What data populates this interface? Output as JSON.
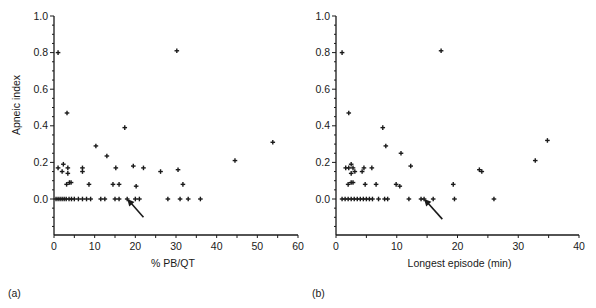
{
  "chart_data": [
    {
      "panel_label": "(a)",
      "type": "scatter",
      "title": "",
      "xlabel": "% PB/QT",
      "ylabel": "Apneic index",
      "xlim": [
        0,
        60
      ],
      "ylim": [
        -0.15,
        1.0
      ],
      "xticks": [
        0,
        10,
        20,
        30,
        40,
        50,
        60
      ],
      "yticks": [
        0.0,
        0.2,
        0.4,
        0.6,
        0.8,
        1.0
      ],
      "ytick_labels": [
        "0.0",
        "0.2",
        "0.4",
        "0.6",
        "0.8",
        "1.0"
      ],
      "grid": false,
      "marker": "+",
      "annotation": {
        "type": "arrow",
        "points_to": [
          18,
          0.0
        ],
        "from": [
          22,
          -0.1
        ]
      },
      "points": [
        [
          1,
          0.8
        ],
        [
          3.2,
          0.47
        ],
        [
          10.3,
          0.29
        ],
        [
          13,
          0.235
        ],
        [
          17.4,
          0.39
        ],
        [
          30.2,
          0.81
        ],
        [
          53.8,
          0.31
        ],
        [
          44.5,
          0.21
        ],
        [
          1,
          0.17
        ],
        [
          2.3,
          0.19
        ],
        [
          2,
          0.15
        ],
        [
          3.4,
          0.17
        ],
        [
          3.4,
          0.14
        ],
        [
          3.1,
          0.08
        ],
        [
          3.8,
          0.09
        ],
        [
          4.2,
          0.09
        ],
        [
          7,
          0.17
        ],
        [
          7,
          0.15
        ],
        [
          8.6,
          0.08
        ],
        [
          15.2,
          0.17
        ],
        [
          14.5,
          0.08
        ],
        [
          16,
          0.08
        ],
        [
          19.5,
          0.18
        ],
        [
          20.2,
          0.07
        ],
        [
          22,
          0.17
        ],
        [
          26.2,
          0.15
        ],
        [
          30.5,
          0.16
        ],
        [
          31.7,
          0.08
        ],
        [
          0.5,
          0
        ],
        [
          1,
          0
        ],
        [
          1.5,
          0
        ],
        [
          2,
          0
        ],
        [
          2.5,
          0
        ],
        [
          3,
          0
        ],
        [
          3.7,
          0
        ],
        [
          4.3,
          0
        ],
        [
          5,
          0
        ],
        [
          6,
          0
        ],
        [
          7,
          0
        ],
        [
          8,
          0
        ],
        [
          9,
          0
        ],
        [
          11.5,
          0
        ],
        [
          12.5,
          0
        ],
        [
          15,
          0
        ],
        [
          16,
          0
        ],
        [
          18,
          0
        ],
        [
          20,
          0
        ],
        [
          21,
          0
        ],
        [
          28,
          0
        ],
        [
          31,
          0
        ],
        [
          33,
          0
        ],
        [
          36,
          0
        ]
      ]
    },
    {
      "panel_label": "(b)",
      "type": "scatter",
      "title": "",
      "xlabel": "Longest episode (min)",
      "ylabel": "",
      "xlim": [
        0,
        40
      ],
      "ylim": [
        -0.15,
        1.0
      ],
      "xticks": [
        0,
        10,
        20,
        30,
        40
      ],
      "yticks": [
        0.0,
        0.2,
        0.4,
        0.6,
        0.8,
        1.0
      ],
      "ytick_labels": [
        "0.0",
        "0.2",
        "0.4",
        "0.6",
        "0.8",
        "1.0"
      ],
      "grid": false,
      "marker": "+",
      "annotation": {
        "type": "arrow",
        "points_to": [
          14.5,
          0.0
        ],
        "from": [
          17.5,
          -0.11
        ]
      },
      "points": [
        [
          1,
          0.8
        ],
        [
          2.1,
          0.47
        ],
        [
          7.7,
          0.39
        ],
        [
          8.2,
          0.29
        ],
        [
          10.7,
          0.25
        ],
        [
          17.3,
          0.81
        ],
        [
          34.8,
          0.32
        ],
        [
          32.8,
          0.21
        ],
        [
          1.6,
          0.17
        ],
        [
          2.1,
          0.17
        ],
        [
          2.5,
          0.19
        ],
        [
          2.8,
          0.17
        ],
        [
          2.5,
          0.14
        ],
        [
          3.1,
          0.15
        ],
        [
          4.3,
          0.15
        ],
        [
          4.6,
          0.17
        ],
        [
          5.9,
          0.17
        ],
        [
          2,
          0.08
        ],
        [
          2.5,
          0.09
        ],
        [
          2.8,
          0.09
        ],
        [
          4.8,
          0.08
        ],
        [
          6.6,
          0.08
        ],
        [
          9.9,
          0.08
        ],
        [
          10.5,
          0.07
        ],
        [
          12.3,
          0.18
        ],
        [
          19.3,
          0.08
        ],
        [
          23.6,
          0.16
        ],
        [
          24,
          0.15
        ],
        [
          1,
          0
        ],
        [
          1.5,
          0
        ],
        [
          2,
          0
        ],
        [
          2.5,
          0
        ],
        [
          3,
          0
        ],
        [
          3.5,
          0
        ],
        [
          4,
          0
        ],
        [
          4.5,
          0
        ],
        [
          5,
          0
        ],
        [
          5.5,
          0
        ],
        [
          6,
          0
        ],
        [
          7,
          0
        ],
        [
          8,
          0
        ],
        [
          8.5,
          0
        ],
        [
          12,
          0
        ],
        [
          14,
          0
        ],
        [
          14.5,
          0
        ],
        [
          16,
          0
        ],
        [
          19.5,
          0
        ],
        [
          26,
          0
        ]
      ]
    }
  ],
  "colors": {
    "ink": "#1a1a1a",
    "background": "#ffffff"
  }
}
